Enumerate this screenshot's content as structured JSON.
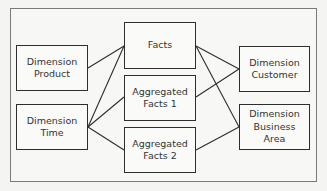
{
  "diagram": {
    "type": "star-schema",
    "nodes": [
      {
        "id": "dim_product",
        "label": "Dimension\nProduct",
        "kind": "dimension"
      },
      {
        "id": "dim_time",
        "label": "Dimension\nTime",
        "kind": "dimension"
      },
      {
        "id": "facts",
        "label": "Facts",
        "kind": "fact"
      },
      {
        "id": "agg_facts_1",
        "label": "Aggregated\nFacts 1",
        "kind": "fact"
      },
      {
        "id": "agg_facts_2",
        "label": "Aggregated\nFacts 2",
        "kind": "fact"
      },
      {
        "id": "dim_customer",
        "label": "Dimension\nCustomer",
        "kind": "dimension"
      },
      {
        "id": "dim_business_area",
        "label": "Dimension\nBusiness\nArea",
        "kind": "dimension"
      }
    ],
    "edges": [
      {
        "from": "dim_product",
        "to": "facts"
      },
      {
        "from": "dim_time",
        "to": "facts"
      },
      {
        "from": "dim_time",
        "to": "agg_facts_1"
      },
      {
        "from": "dim_time",
        "to": "agg_facts_2"
      },
      {
        "from": "facts",
        "to": "dim_customer"
      },
      {
        "from": "facts",
        "to": "dim_business_area"
      },
      {
        "from": "agg_facts_1",
        "to": "dim_customer"
      },
      {
        "from": "agg_facts_2",
        "to": "dim_business_area"
      }
    ]
  }
}
